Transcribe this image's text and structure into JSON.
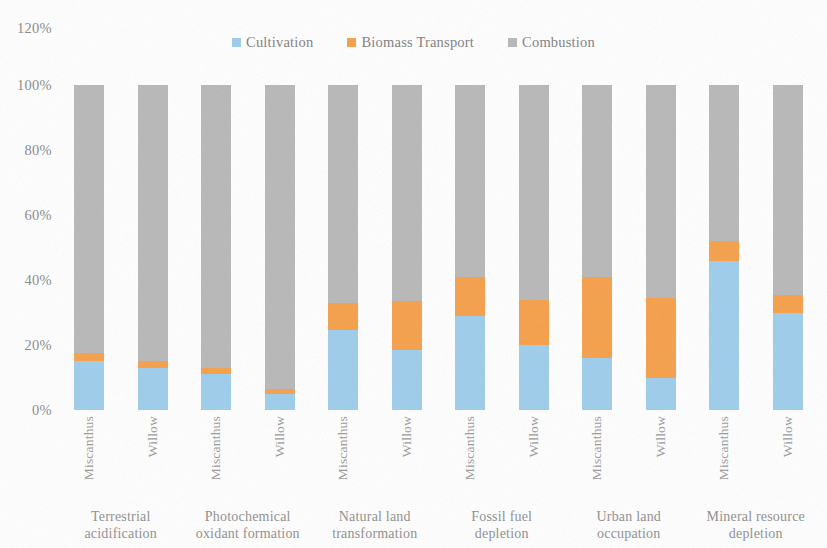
{
  "chart_data": {
    "type": "bar",
    "stacked": true,
    "normalized": true,
    "title": "",
    "xlabel": "",
    "ylabel": "",
    "ylim": [
      0,
      120
    ],
    "ytick_labels": [
      "0%",
      "20%",
      "40%",
      "60%",
      "80%",
      "100%",
      "120%"
    ],
    "ytick_values": [
      0,
      20,
      40,
      60,
      80,
      100,
      120
    ],
    "grid": false,
    "legend_position": "top-center",
    "legend": [
      "Cultivation",
      "Biomass Transport",
      "Combustion"
    ],
    "colors": {
      "cultivation": "#9dcdec",
      "biomass_transport": "#f6a04a",
      "combustion": "#b8b8b8"
    },
    "categories": [
      "Miscanthus",
      "Willow",
      "Miscanthus",
      "Willow",
      "Miscanthus",
      "Willow",
      "Miscanthus",
      "Willow",
      "Miscanthus",
      "Willow",
      "Miscanthus",
      "Willow"
    ],
    "groups": [
      {
        "line1": "Terrestrial",
        "line2": "acidification"
      },
      {
        "line1": "Photochemical",
        "line2": "oxidant formation"
      },
      {
        "line1": "Natural land",
        "line2": "transformation"
      },
      {
        "line1": "Fossil fuel",
        "line2": "depletion"
      },
      {
        "line1": "Urban land",
        "line2": "occupation"
      },
      {
        "line1": "Mineral resource",
        "line2": "depletion"
      }
    ],
    "series": [
      {
        "name": "Cultivation",
        "values": [
          15,
          13,
          11,
          5,
          24.5,
          18.5,
          29,
          20,
          16,
          10,
          46,
          30
        ]
      },
      {
        "name": "Biomass Transport",
        "values": [
          2.5,
          2,
          2,
          1.5,
          8.5,
          15,
          12,
          14,
          25,
          24.5,
          6,
          5.5
        ]
      },
      {
        "name": "Combustion",
        "values": [
          82.5,
          85,
          87,
          93.5,
          67,
          66.5,
          59,
          66,
          59,
          65.5,
          48,
          64.5
        ]
      }
    ]
  }
}
